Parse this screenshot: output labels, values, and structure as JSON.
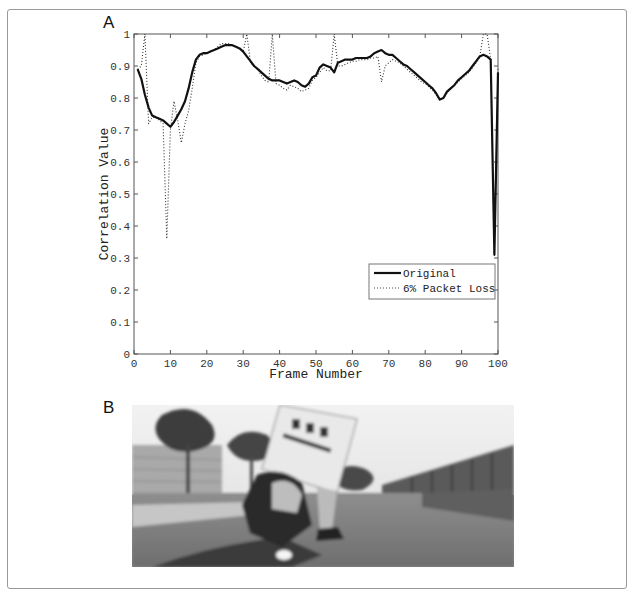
{
  "panels": {
    "a_label": "A",
    "b_label": "B"
  },
  "chart_data": {
    "type": "line",
    "title": "",
    "xlabel": "Frame Number",
    "ylabel": "Correlation Value",
    "xlim": [
      0,
      100
    ],
    "ylim": [
      0,
      1
    ],
    "xticks": [
      0,
      10,
      20,
      30,
      40,
      50,
      60,
      70,
      80,
      90,
      100
    ],
    "yticks": [
      0,
      0.1,
      0.2,
      0.3,
      0.4,
      0.5,
      0.6,
      0.7,
      0.8,
      0.9,
      1
    ],
    "xtick_labels": [
      "0",
      "10",
      "20",
      "30",
      "40",
      "50",
      "60",
      "70",
      "80",
      "90",
      "100"
    ],
    "ytick_labels": [
      "0",
      "0.1",
      "0.2",
      "0.3",
      "0.4",
      "0.5",
      "0.6",
      "0.7",
      "0.8",
      "0.9",
      "1"
    ],
    "grid": false,
    "legend_position": "lower-right of center",
    "x": [
      1,
      2,
      3,
      4,
      5,
      6,
      7,
      8,
      9,
      10,
      11,
      12,
      13,
      14,
      15,
      16,
      17,
      18,
      19,
      20,
      21,
      22,
      23,
      24,
      25,
      26,
      27,
      28,
      29,
      30,
      31,
      32,
      33,
      34,
      35,
      36,
      37,
      38,
      39,
      40,
      41,
      42,
      43,
      44,
      45,
      46,
      47,
      48,
      49,
      50,
      51,
      52,
      53,
      54,
      55,
      56,
      57,
      58,
      59,
      60,
      61,
      62,
      63,
      64,
      65,
      66,
      67,
      68,
      69,
      70,
      71,
      72,
      73,
      74,
      75,
      76,
      77,
      78,
      79,
      80,
      81,
      82,
      83,
      84,
      85,
      86,
      87,
      88,
      89,
      90,
      91,
      92,
      93,
      94,
      95,
      96,
      97,
      98,
      99,
      100
    ],
    "series": [
      {
        "name": "Original",
        "style": "solid",
        "color": "#111111",
        "values": [
          0.89,
          0.86,
          0.81,
          0.77,
          0.745,
          0.74,
          0.735,
          0.73,
          0.72,
          0.71,
          0.725,
          0.745,
          0.765,
          0.79,
          0.83,
          0.88,
          0.92,
          0.935,
          0.94,
          0.94,
          0.945,
          0.95,
          0.955,
          0.96,
          0.965,
          0.965,
          0.965,
          0.96,
          0.955,
          0.945,
          0.93,
          0.915,
          0.9,
          0.89,
          0.88,
          0.87,
          0.86,
          0.855,
          0.855,
          0.855,
          0.85,
          0.845,
          0.85,
          0.855,
          0.85,
          0.84,
          0.835,
          0.845,
          0.865,
          0.87,
          0.895,
          0.905,
          0.9,
          0.895,
          0.88,
          0.91,
          0.915,
          0.92,
          0.92,
          0.92,
          0.925,
          0.925,
          0.925,
          0.925,
          0.93,
          0.94,
          0.945,
          0.95,
          0.94,
          0.935,
          0.935,
          0.925,
          0.915,
          0.905,
          0.9,
          0.89,
          0.88,
          0.87,
          0.86,
          0.85,
          0.84,
          0.83,
          0.815,
          0.795,
          0.8,
          0.82,
          0.83,
          0.84,
          0.855,
          0.865,
          0.875,
          0.885,
          0.9,
          0.915,
          0.93,
          0.935,
          0.93,
          0.92,
          0.31,
          0.88
        ]
      },
      {
        "name": "6% Packet Loss",
        "style": "dotted",
        "color": "#333333",
        "values": [
          0.89,
          0.9,
          1.0,
          0.72,
          0.74,
          0.74,
          0.73,
          0.72,
          0.36,
          0.7,
          0.79,
          0.73,
          0.66,
          0.72,
          0.76,
          0.83,
          0.91,
          0.93,
          0.935,
          0.94,
          0.945,
          0.95,
          0.96,
          0.97,
          0.97,
          0.97,
          0.965,
          0.96,
          0.955,
          0.945,
          1.0,
          0.91,
          0.9,
          0.89,
          0.87,
          0.855,
          0.85,
          1.0,
          0.845,
          0.84,
          0.83,
          0.825,
          0.84,
          0.835,
          0.83,
          0.82,
          0.825,
          0.83,
          0.855,
          0.865,
          0.88,
          0.895,
          0.885,
          0.885,
          1.0,
          0.9,
          0.9,
          0.905,
          0.91,
          0.915,
          0.915,
          0.92,
          0.92,
          0.92,
          0.925,
          0.925,
          0.93,
          0.85,
          0.9,
          0.91,
          0.92,
          0.915,
          0.91,
          0.9,
          0.89,
          0.88,
          0.87,
          0.86,
          0.85,
          0.845,
          0.835,
          0.825,
          0.81,
          0.795,
          0.8,
          0.815,
          0.83,
          0.84,
          0.85,
          0.86,
          0.87,
          0.88,
          0.895,
          0.91,
          0.93,
          1.0,
          1.0,
          0.92,
          0.31,
          0.89
        ]
      }
    ]
  },
  "photo": {
    "description": "Motorcycle rider carrying a sign board, road with trees and buildings"
  }
}
